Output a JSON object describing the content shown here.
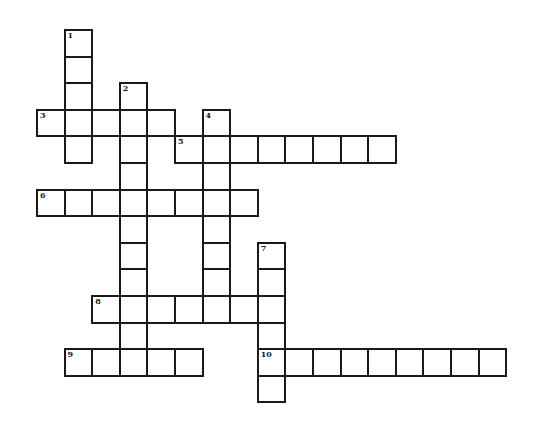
{
  "puzzle": {
    "cell_width": 27.6,
    "cell_height": 26.6,
    "origin_x": 36,
    "origin_y": 29,
    "border_color": "#1a1a1a",
    "background": "#ffffff",
    "entries": [
      {
        "number": "1",
        "direction": "down",
        "col": 1,
        "row": 0,
        "length": 5
      },
      {
        "number": "2",
        "direction": "down",
        "col": 3,
        "row": 2,
        "length": 11
      },
      {
        "number": "3",
        "direction": "across",
        "col": 0,
        "row": 3,
        "length": 5
      },
      {
        "number": "4",
        "direction": "down",
        "col": 6,
        "row": 3,
        "length": 8
      },
      {
        "number": "5",
        "direction": "across",
        "col": 5,
        "row": 4,
        "length": 8
      },
      {
        "number": "6",
        "direction": "across",
        "col": 0,
        "row": 6,
        "length": 8
      },
      {
        "number": "7",
        "direction": "down",
        "col": 8,
        "row": 8,
        "length": 6
      },
      {
        "number": "8",
        "direction": "across",
        "col": 2,
        "row": 10,
        "length": 7
      },
      {
        "number": "9",
        "direction": "across",
        "col": 1,
        "row": 12,
        "length": 5
      },
      {
        "number": "10",
        "direction": "across",
        "col": 8,
        "row": 12,
        "length": 9
      }
    ]
  }
}
